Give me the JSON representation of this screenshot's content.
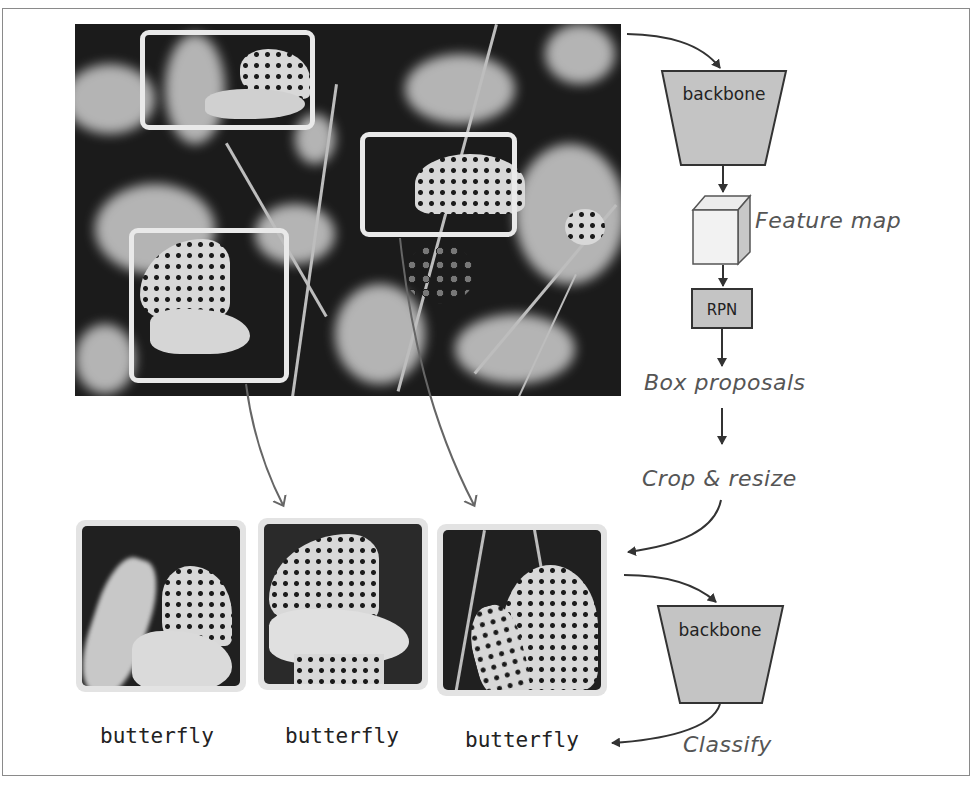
{
  "diagram": {
    "stage1": {
      "backbone_label": "backbone",
      "feature_map_label": "Feature map",
      "rpn_label": "RPN",
      "box_proposals_label": "Box proposals",
      "crop_resize_label": "Crop & resize"
    },
    "stage2": {
      "backbone_label": "backbone",
      "classify_label": "Classify"
    },
    "input_image": {
      "description": "Grayscale photo of butterflies among flowers",
      "boxes": [
        {
          "id": "box-1",
          "x": 140,
          "y": 30,
          "w": 175,
          "h": 100
        },
        {
          "id": "box-2",
          "x": 360,
          "y": 130,
          "w": 158,
          "h": 105
        },
        {
          "id": "box-3",
          "x": 128,
          "y": 228,
          "w": 160,
          "h": 155
        }
      ]
    },
    "crops": [
      {
        "label": "butterfly"
      },
      {
        "label": "butterfly"
      },
      {
        "label": "butterfly"
      }
    ],
    "colors": {
      "box_fill": "#c4c4c4",
      "stroke": "#333333",
      "handwriting": "#555555",
      "bbox_outline": "#e9e9e9"
    }
  }
}
